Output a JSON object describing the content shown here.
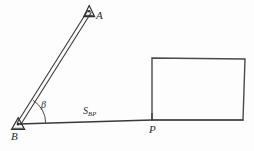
{
  "figure": {
    "background_color": "#fdfdfd",
    "ink_color": "#3a3a3a",
    "labels": {
      "point_a": "A",
      "point_b": "B",
      "point_p": "P",
      "angle_beta": "β",
      "baseline_main": "S",
      "baseline_sub": "BP"
    },
    "icons": {
      "station_a": "survey-station-triangle",
      "station_b": "survey-station-triangle",
      "pole": "survey-pole-double-line",
      "angle": "angle-arc",
      "building": "building-outline-rectangle"
    },
    "geometry": {
      "station_b": {
        "x": 18,
        "y": 124
      },
      "station_a": {
        "x": 89,
        "y": 11
      },
      "point_p": {
        "x": 152,
        "y": 120
      },
      "pole_width_px": 3,
      "angle_arc_radius_px": 28,
      "building_corners": [
        {
          "x": 152,
          "y": 58
        },
        {
          "x": 245,
          "y": 59
        },
        {
          "x": 243,
          "y": 120
        },
        {
          "x": 152,
          "y": 120
        }
      ]
    }
  }
}
